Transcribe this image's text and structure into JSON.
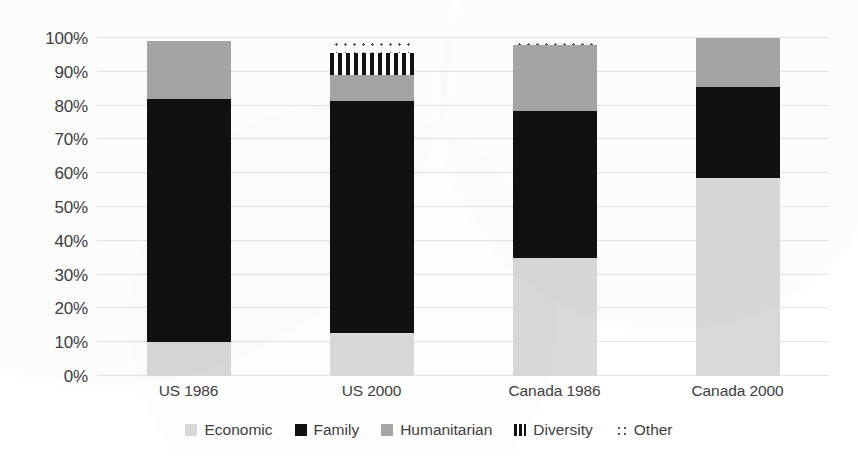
{
  "chart_data": {
    "type": "bar",
    "subtype": "stacked-percentage",
    "title": "",
    "xlabel": "",
    "ylabel": "",
    "ylim": [
      0,
      100
    ],
    "grid": true,
    "legend_position": "bottom",
    "categories": [
      "US 1986",
      "US 2000",
      "Canada 1986",
      "Canada 2000"
    ],
    "ytick_labels": [
      "0%",
      "10%",
      "20%",
      "30%",
      "40%",
      "50%",
      "60%",
      "70%",
      "80%",
      "90%",
      "100%"
    ],
    "ytick_values": [
      0,
      10,
      20,
      30,
      40,
      50,
      60,
      70,
      80,
      90,
      100
    ],
    "series": [
      {
        "name": "Economic",
        "color": "#d9d9d9",
        "pattern": "solid",
        "values": [
          10,
          12.7,
          35,
          58.5
        ]
      },
      {
        "name": "Family",
        "color": "#111111",
        "pattern": "solid",
        "values": [
          72,
          68.8,
          43.5,
          27
        ]
      },
      {
        "name": "Humanitarian",
        "color": "#a6a6a6",
        "pattern": "solid",
        "values": [
          17,
          7.5,
          19.5,
          14.5
        ]
      },
      {
        "name": "Diversity",
        "color": "#111111",
        "pattern": "vertical-stripes",
        "values": [
          0,
          6.5,
          0,
          0
        ]
      },
      {
        "name": "Other",
        "color": "#555555",
        "pattern": "dotted",
        "values": [
          1,
          4.5,
          2,
          0
        ]
      }
    ]
  },
  "legend": {
    "items": [
      {
        "label": "Economic",
        "swatch": "economic-swatch-icon"
      },
      {
        "label": "Family",
        "swatch": "family-swatch-icon"
      },
      {
        "label": "Humanitarian",
        "swatch": "humanitarian-swatch-icon"
      },
      {
        "label": "Diversity",
        "swatch": "diversity-swatch-icon"
      },
      {
        "label": "Other",
        "swatch": "other-swatch-icon"
      }
    ]
  }
}
